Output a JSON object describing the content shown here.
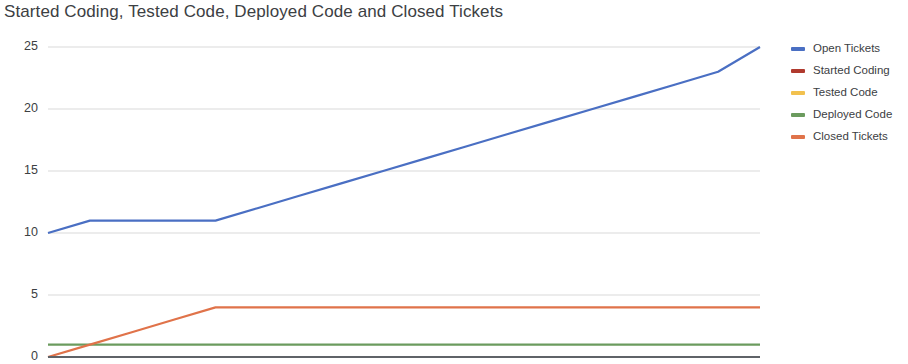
{
  "chart_data": {
    "type": "line",
    "title": "Started Coding, Tested Code, Deployed Code and Closed Tickets",
    "xlabel": "",
    "ylabel": "",
    "ylim": [
      0,
      25
    ],
    "yticks": [
      0,
      5,
      10,
      15,
      20,
      25
    ],
    "ytick_labels": [
      "0",
      "5",
      "10",
      "15",
      "20",
      "25"
    ],
    "grid": true,
    "grid_axis": "y",
    "legend_position": "right",
    "x": [
      0,
      1,
      2,
      3,
      4,
      5,
      6,
      7,
      8,
      9,
      10,
      11,
      12,
      13,
      14,
      15,
      16,
      17
    ],
    "series": [
      {
        "name": "Open Tickets",
        "color": "#4A6FC3",
        "values": [
          10,
          11,
          11,
          11,
          11,
          12,
          13,
          14,
          15,
          16,
          17,
          18,
          19,
          20,
          21,
          22,
          23,
          25
        ]
      },
      {
        "name": "Started Coding",
        "color": "#B03A2E",
        "values": [
          0,
          0,
          0,
          0,
          0,
          0,
          0,
          0,
          0,
          0,
          0,
          0,
          0,
          0,
          0,
          0,
          0,
          0
        ]
      },
      {
        "name": "Tested Code",
        "color": "#F2C14E",
        "values": [
          0,
          0,
          0,
          0,
          0,
          0,
          0,
          0,
          0,
          0,
          0,
          0,
          0,
          0,
          0,
          0,
          0,
          0
        ]
      },
      {
        "name": "Deployed Code",
        "color": "#6B9B5E",
        "values": [
          1,
          1,
          1,
          1,
          1,
          1,
          1,
          1,
          1,
          1,
          1,
          1,
          1,
          1,
          1,
          1,
          1,
          1
        ]
      },
      {
        "name": "Closed Tickets",
        "color": "#E0734A",
        "values": [
          0,
          1,
          2,
          3,
          4,
          4,
          4,
          4,
          4,
          4,
          4,
          4,
          4,
          4,
          4,
          4,
          4,
          4
        ]
      }
    ]
  },
  "legend": {
    "items": [
      {
        "label": "Open Tickets",
        "color": "#4A6FC3"
      },
      {
        "label": "Started Coding",
        "color": "#B03A2E"
      },
      {
        "label": "Tested Code",
        "color": "#F2C14E"
      },
      {
        "label": "Deployed Code",
        "color": "#6B9B5E"
      },
      {
        "label": "Closed Tickets",
        "color": "#E0734A"
      }
    ]
  },
  "axis": {
    "y_labels": [
      "25",
      "20",
      "15",
      "10",
      "5",
      "0"
    ]
  },
  "colors": {
    "gridline": "#d9d9d9",
    "baseline": "#5f6368",
    "title": "#3c4043",
    "tick_text": "#3c4043"
  }
}
